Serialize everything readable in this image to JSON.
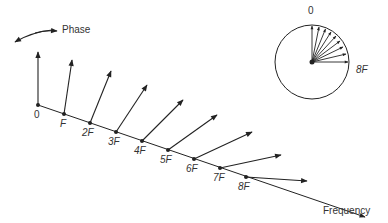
{
  "labels": {
    "phase": "Phase",
    "frequency": "Frequency",
    "freq_ticks": [
      "0",
      "F",
      "2F",
      "3F",
      "4F",
      "5F",
      "6F",
      "7F",
      "8F"
    ],
    "inset_top": "0",
    "inset_right": "8F"
  },
  "colors": {
    "ink": "#222222",
    "background": "#ffffff"
  }
}
